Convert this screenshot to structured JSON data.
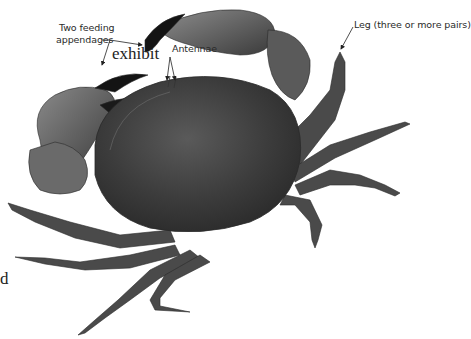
{
  "body_text": {
    "lines": [
      "exhibit",
      "ars of",
      "",
      "d"
    ]
  },
  "labels": {
    "feeding": {
      "line1": "Two feeding",
      "line2": "appendages"
    },
    "antennae": "Antennae",
    "leg": "Leg (three or more pairs)"
  },
  "image": {
    "subject": "crab",
    "colors": {
      "shell": "#3a3a3a",
      "claw_tip": "#111111",
      "leg": "#4a4a4a",
      "background": "#ffffff",
      "text": "#2a2a2a"
    }
  }
}
